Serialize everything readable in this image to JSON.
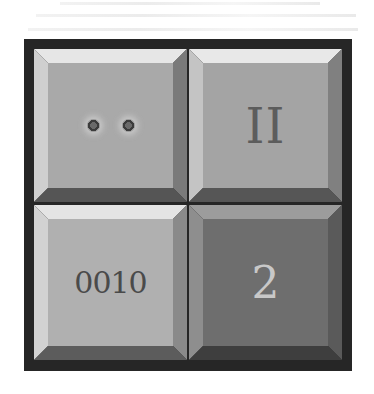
{
  "puzzle": {
    "tiles": [
      {
        "id": "top-left",
        "content_type": "dots",
        "dot_count": 2,
        "face_color": "#a9a9a9",
        "state": "raised"
      },
      {
        "id": "top-right",
        "content_type": "roman",
        "label": "II",
        "face_color": "#a4a4a4",
        "state": "raised"
      },
      {
        "id": "bottom-left",
        "content_type": "binary",
        "label": "0010",
        "face_color": "#b0b0b0",
        "state": "raised"
      },
      {
        "id": "bottom-right",
        "content_type": "arabic",
        "label": "2",
        "face_color": "#6e6e6e",
        "state": "pressed"
      }
    ],
    "colors": {
      "frame": "#262626",
      "bevel_light": "#e4e4e4",
      "bevel_mid": "#bdbdbd",
      "bevel_dark": "#6a6a6a",
      "bevel_darker": "#4a4a4a"
    }
  }
}
